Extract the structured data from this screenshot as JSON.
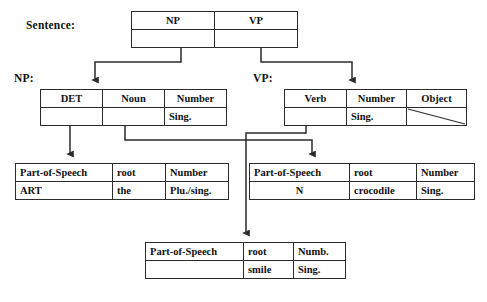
{
  "diagram": {
    "ink_color": "#2b2b2b",
    "background": "#ffffff"
  },
  "labels": {
    "sentence": "Sentence:",
    "np": "NP:",
    "vp": "VP:"
  },
  "tables": {
    "sentence": {
      "name": "sentence-table",
      "headers": [
        "NP",
        "VP"
      ],
      "values": [
        "",
        ""
      ]
    },
    "np": {
      "name": "np-table",
      "headers": [
        "DET",
        "Noun",
        "Number"
      ],
      "values": [
        "",
        "",
        "Sing."
      ]
    },
    "vp": {
      "name": "vp-table",
      "headers": [
        "Verb",
        "Number",
        "Object"
      ],
      "values": [
        "",
        "Sing.",
        "slash-null"
      ]
    },
    "det_lex": {
      "name": "determiner-lexical-table",
      "headers": [
        "Part-of-Speech",
        "root",
        "Number"
      ],
      "values": [
        "ART",
        "the",
        "Plu./sing."
      ]
    },
    "noun_lex": {
      "name": "noun-lexical-table",
      "headers": [
        "Part-of-Speech",
        "root",
        "Number"
      ],
      "values": [
        "N",
        "crocodile",
        "Sing."
      ]
    },
    "verb_lex": {
      "name": "verb-lexical-table",
      "headers": [
        "Part-of-Speech",
        "root",
        "Numb."
      ],
      "values": [
        "",
        "smile",
        "Sing."
      ]
    }
  }
}
